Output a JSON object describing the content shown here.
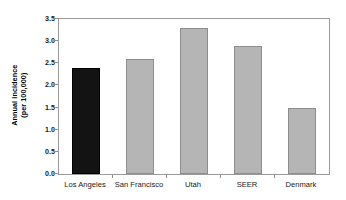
{
  "chart_data": {
    "type": "bar",
    "title": "",
    "subtitle": "",
    "xlabel": "",
    "ylabel": "Annual incidence (per 100,000)",
    "ylabel_lines": [
      "Annual incidence",
      "(per 100,000)"
    ],
    "categories": [
      "Los Angeles",
      "San Francisco",
      "Utah",
      "SEER",
      "Denmark"
    ],
    "values": [
      2.4,
      2.6,
      3.3,
      2.9,
      1.5
    ],
    "bar_colors": [
      "#131313",
      "#b5b5b5",
      "#b5b5b5",
      "#b5b5b5",
      "#b5b5b5"
    ],
    "highlighted_category": "Los Angeles",
    "ylim": [
      0.0,
      3.5
    ],
    "ytick_labels": [
      "0.0",
      "0.5",
      "1.0",
      "1.5",
      "2.0",
      "2.5",
      "3.0",
      "3.5"
    ],
    "ytick_values": [
      0.0,
      0.5,
      1.0,
      1.5,
      2.0,
      2.5,
      3.0,
      3.5
    ],
    "grid": false,
    "legend": false,
    "legend_position": "none",
    "annotations": []
  },
  "style": {
    "background": "#ffffff",
    "frame_color": "#9a9a9a",
    "tick_color": "#8f8f8f",
    "text_color": "#1a1a1a",
    "bar_gray": "#b5b5b5",
    "bar_gray_edge": "#8d8d8d",
    "bar_black": "#131313"
  }
}
